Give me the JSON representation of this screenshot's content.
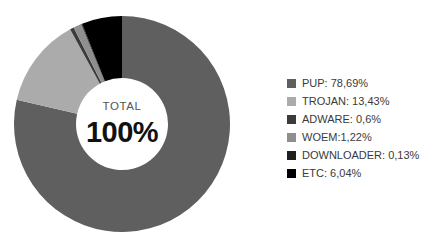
{
  "chart_data": {
    "type": "pie",
    "variant": "donut",
    "title": "",
    "xlabel": "",
    "ylabel": "",
    "units": "percent",
    "decimal_separator": ",",
    "center_caption": "TOTAL",
    "center_value": "100%",
    "legend_position": "right",
    "grid": false,
    "start_angle_deg": 0,
    "direction": "clockwise",
    "categories": [
      "PUP",
      "TROJAN",
      "ADWARE",
      "WOEM",
      "DOWNLOADER",
      "ETC"
    ],
    "values": [
      78.69,
      13.43,
      0.6,
      1.22,
      0.13,
      6.04
    ],
    "labels": [
      "PUP: 78,69%",
      "TROJAN: 13,43%",
      "ADWARE: 0,6%",
      "WOEM:1,22%",
      "DOWNLOADER: 0,13%",
      "ETC: 6,04%"
    ],
    "colors": [
      "#5f5f5f",
      "#ababab",
      "#3b3b3b",
      "#8f8f8f",
      "#1f1f1f",
      "#000000"
    ],
    "slices": [
      {
        "name": "PUP",
        "value": 78.69,
        "label": "PUP: 78,69%",
        "color": "#5f5f5f"
      },
      {
        "name": "TROJAN",
        "value": 13.43,
        "label": "TROJAN: 13,43%",
        "color": "#ababab"
      },
      {
        "name": "ADWARE",
        "value": 0.6,
        "label": "ADWARE: 0,6%",
        "color": "#3b3b3b"
      },
      {
        "name": "WOEM",
        "value": 1.22,
        "label": "WOEM:1,22%",
        "color": "#8f8f8f"
      },
      {
        "name": "DOWNLOADER",
        "value": 0.13,
        "label": "DOWNLOADER: 0,13%",
        "color": "#1f1f1f"
      },
      {
        "name": "ETC",
        "value": 6.04,
        "label": "ETC: 6,04%",
        "color": "#000000"
      }
    ]
  },
  "legend": {
    "items": [
      {
        "label": "PUP: 78,69%",
        "color": "#5f5f5f"
      },
      {
        "label": "TROJAN: 13,43%",
        "color": "#ababab"
      },
      {
        "label": "ADWARE: 0,6%",
        "color": "#3b3b3b"
      },
      {
        "label": "WOEM:1,22%",
        "color": "#8f8f8f"
      },
      {
        "label": "DOWNLOADER: 0,13%",
        "color": "#1f1f1f"
      },
      {
        "label": "ETC: 6,04%",
        "color": "#000000"
      }
    ]
  },
  "center": {
    "caption": "TOTAL",
    "value": "100%"
  }
}
